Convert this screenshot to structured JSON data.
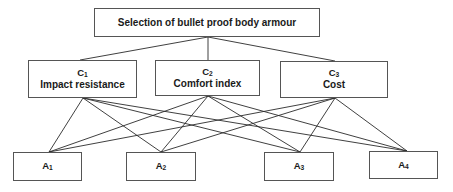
{
  "goal": {
    "label": "Selection of bullet proof body armour"
  },
  "criteria": [
    {
      "code": "C",
      "sub": "1",
      "label": "Impact resistance"
    },
    {
      "code": "C",
      "sub": "2",
      "label": "Comfort index"
    },
    {
      "code": "C",
      "sub": "3",
      "label": "Cost"
    }
  ],
  "alternatives": [
    {
      "code": "A",
      "sub": "1"
    },
    {
      "code": "A",
      "sub": "2"
    },
    {
      "code": "A",
      "sub": "3"
    },
    {
      "code": "A",
      "sub": "4"
    }
  ],
  "style": {
    "line_color": "#2a2a2a",
    "border_color": "#555555"
  },
  "connections": {
    "goal_to_criteria": [
      "C1",
      "C2",
      "C3"
    ],
    "criteria_to_alternatives": "each criterion connects to all alternatives A1–A4"
  }
}
